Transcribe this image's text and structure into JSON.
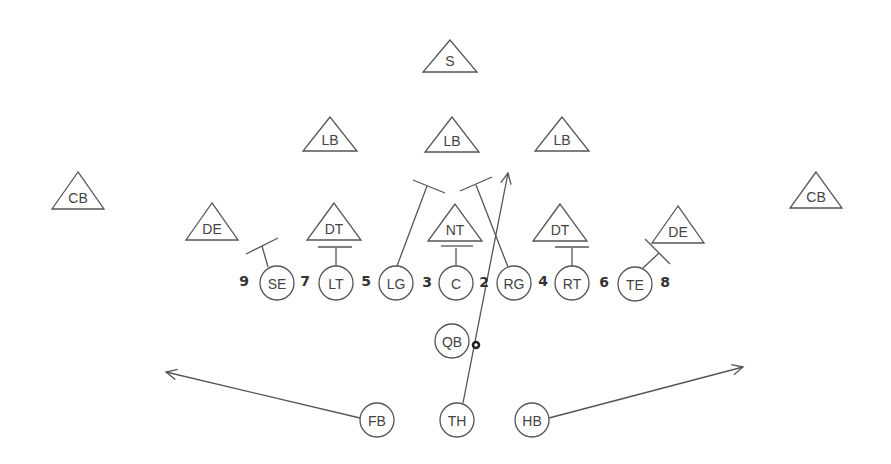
{
  "diagram": {
    "colors": {
      "stroke": "#555555",
      "text": "#444444",
      "background": "#ffffff"
    },
    "defense": [
      {
        "id": "s",
        "label": "S",
        "shape": "triangle",
        "x": 450,
        "top": 40,
        "bottom": 72,
        "half": 27
      },
      {
        "id": "lb1",
        "label": "LB",
        "shape": "triangle",
        "x": 330,
        "top": 117,
        "bottom": 151,
        "half": 27
      },
      {
        "id": "lb2",
        "label": "LB",
        "shape": "triangle",
        "x": 452,
        "top": 117,
        "bottom": 152,
        "half": 27
      },
      {
        "id": "lb3",
        "label": "LB",
        "shape": "triangle",
        "x": 562,
        "top": 117,
        "bottom": 151,
        "half": 27
      },
      {
        "id": "cb1",
        "label": "CB",
        "shape": "triangle",
        "x": 78,
        "top": 172,
        "bottom": 209,
        "half": 26
      },
      {
        "id": "cb2",
        "label": "CB",
        "shape": "triangle",
        "x": 816,
        "top": 172,
        "bottom": 208,
        "half": 26
      },
      {
        "id": "de1",
        "label": "DE",
        "shape": "triangle",
        "x": 212,
        "top": 203,
        "bottom": 240,
        "half": 26
      },
      {
        "id": "dt1",
        "label": "DT",
        "shape": "triangle",
        "x": 334,
        "top": 203,
        "bottom": 240,
        "half": 27
      },
      {
        "id": "nt",
        "label": "NT",
        "shape": "triangle",
        "x": 455,
        "top": 204,
        "bottom": 241,
        "half": 27
      },
      {
        "id": "dt2",
        "label": "DT",
        "shape": "triangle",
        "x": 560,
        "top": 204,
        "bottom": 241,
        "half": 27
      },
      {
        "id": "de2",
        "label": "DE",
        "shape": "triangle",
        "x": 678,
        "top": 206,
        "bottom": 243,
        "half": 26
      }
    ],
    "offense": [
      {
        "id": "se",
        "label": "SE",
        "x": 277,
        "y": 283,
        "r": 17
      },
      {
        "id": "lt",
        "label": "LT",
        "x": 336,
        "y": 283,
        "r": 17
      },
      {
        "id": "lg",
        "label": "LG",
        "x": 396,
        "y": 283,
        "r": 17
      },
      {
        "id": "c",
        "label": "C",
        "x": 456,
        "y": 283,
        "r": 17
      },
      {
        "id": "rg",
        "label": "RG",
        "x": 514,
        "y": 283,
        "r": 17
      },
      {
        "id": "rt",
        "label": "RT",
        "x": 572,
        "y": 283,
        "r": 17
      },
      {
        "id": "te",
        "label": "TE",
        "x": 635,
        "y": 284,
        "r": 17
      },
      {
        "id": "qb",
        "label": "QB",
        "x": 452,
        "y": 341,
        "r": 17
      },
      {
        "id": "fb",
        "label": "FB",
        "x": 377,
        "y": 420,
        "r": 17
      },
      {
        "id": "th",
        "label": "TH",
        "x": 457,
        "y": 420,
        "r": 17
      },
      {
        "id": "hb",
        "label": "HB",
        "x": 532,
        "y": 420,
        "r": 17
      }
    ],
    "hole_numbers": [
      {
        "label": "9",
        "x": 244,
        "y": 281
      },
      {
        "label": "7",
        "x": 305,
        "y": 281
      },
      {
        "label": "5",
        "x": 366,
        "y": 281
      },
      {
        "label": "3",
        "x": 427,
        "y": 282
      },
      {
        "label": "2",
        "x": 484,
        "y": 282
      },
      {
        "label": "4",
        "x": 543,
        "y": 281
      },
      {
        "label": "6",
        "x": 604,
        "y": 282
      },
      {
        "label": "8",
        "x": 665,
        "y": 282
      }
    ],
    "blocks": [
      {
        "from": "se",
        "path": [
          [
            268,
            267
          ],
          [
            262,
            246
          ]
        ],
        "cap": [
          [
            246,
            254
          ],
          [
            278,
            238
          ]
        ]
      },
      {
        "from": "lt",
        "path": [
          [
            336,
            266
          ],
          [
            336,
            248
          ]
        ],
        "cap": [
          [
            318,
            247
          ],
          [
            352,
            247
          ]
        ]
      },
      {
        "from": "c",
        "path": [
          [
            456,
            266
          ],
          [
            456,
            248
          ]
        ],
        "cap": [
          [
            441,
            246
          ],
          [
            473,
            246
          ]
        ]
      },
      {
        "from": "rt",
        "path": [
          [
            572,
            266
          ],
          [
            572,
            248
          ]
        ],
        "cap": [
          [
            555,
            247
          ],
          [
            589,
            247
          ]
        ]
      },
      {
        "from": "lg",
        "path": [
          [
            397,
            266
          ],
          [
            427,
            186
          ]
        ],
        "cap": [
          [
            413,
            180
          ],
          [
            445,
            193
          ]
        ]
      },
      {
        "from": "rg",
        "path": [
          [
            508,
            267
          ],
          [
            476,
            185
          ]
        ],
        "cap": [
          [
            460,
            191
          ],
          [
            492,
            177
          ]
        ]
      },
      {
        "from": "te",
        "path": [
          [
            643,
            268
          ],
          [
            659,
            253
          ]
        ],
        "cap": [
          [
            645,
            239
          ],
          [
            670,
            264
          ]
        ]
      }
    ],
    "routes": [
      {
        "from": "th",
        "to": "upfield",
        "path": [
          [
            463,
            403
          ],
          [
            508,
            173
          ]
        ],
        "arrow": true
      },
      {
        "from": "fb",
        "to": "left-flat",
        "path": [
          [
            360,
            418
          ],
          [
            166,
            372
          ]
        ],
        "arrow": true
      },
      {
        "from": "hb",
        "to": "right-flat",
        "path": [
          [
            549,
            418
          ],
          [
            743,
            367
          ]
        ],
        "arrow": true
      }
    ],
    "ball": {
      "x": 476,
      "y": 345,
      "r": 3
    }
  }
}
